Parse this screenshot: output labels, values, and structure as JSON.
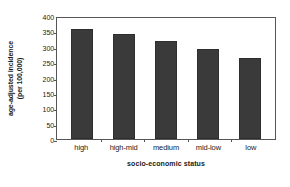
{
  "chart_data": {
    "type": "bar",
    "title": "",
    "subtitle": "",
    "xlabel": "socio-economic status",
    "ylabel": "age-adjusted incidence (per 100,000)",
    "ylabel_lines": [
      "age-adjusted incidence",
      "(per 100,000)"
    ],
    "categories": [
      "high",
      "high-mid",
      "medium",
      "mid-low",
      "low"
    ],
    "values": [
      357,
      340,
      318,
      292,
      265
    ],
    "series": [
      {
        "name": "age-adjusted incidence",
        "values": [
          357,
          340,
          318,
          292,
          265
        ]
      }
    ],
    "ylim": [
      0,
      400
    ],
    "yticks": [
      400,
      350,
      300,
      250,
      200,
      150,
      100,
      50,
      0
    ],
    "ytick_labels": [
      "400",
      "350",
      "300",
      "250",
      "200",
      "150",
      "100",
      "50",
      "0"
    ],
    "grid": false,
    "legend": false,
    "legend_position": "none",
    "bar_color": "#3a3a3a",
    "frame_color": "#555555",
    "background_color": "#ffffff",
    "annotations": []
  }
}
